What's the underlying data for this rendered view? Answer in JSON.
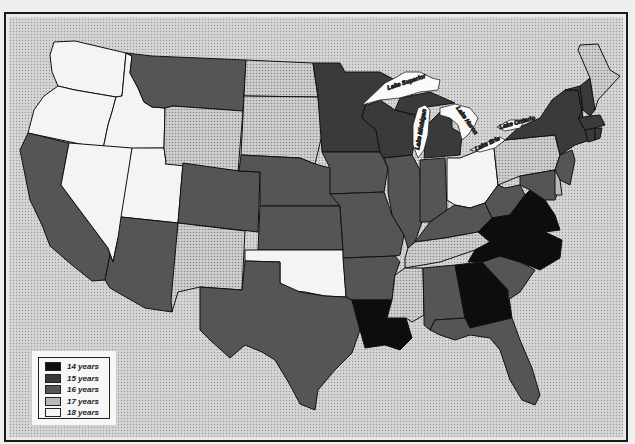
{
  "caption": "",
  "legend": {
    "items": [
      {
        "label": "14 years",
        "color": "#0d0d0d"
      },
      {
        "label": "15 years",
        "color": "#3a3a3a"
      },
      {
        "label": "16 years",
        "color": "#555555"
      },
      {
        "label": "17 years",
        "color": "#b8b8b8"
      },
      {
        "label": "18 years",
        "color": "#f4f4f4"
      }
    ]
  },
  "lakes": {
    "superior": "Lake Superior",
    "michigan": "Lake Michigan",
    "huron": "Lake Huron",
    "erie": "Lake Erie",
    "ontario": "Lake Ontario"
  },
  "colors": {
    "background": "#e8e8e8",
    "border": "#1a1a1a",
    "c14": "#0d0d0d",
    "c15": "#3a3a3a",
    "c16": "#555555",
    "c17": "#b8b8b8",
    "c18": "#f4f4f4"
  },
  "states": {
    "WA": 18,
    "OR": 18,
    "ID": 18,
    "NV": 18,
    "UT": 18,
    "OK": 18,
    "OH": 18,
    "CA": 16,
    "MT": 16,
    "AZ": 16,
    "CO": 16,
    "NE": 16,
    "KS": 16,
    "TX": 16,
    "MN": 15,
    "WI": 15,
    "IA": 16,
    "MO": 16,
    "IL": 16,
    "IN": 16,
    "MI": 15,
    "AR": 16,
    "KY": 16,
    "WV": 16,
    "AL": 16,
    "SC": 16,
    "FL": 16,
    "NY": 15,
    "VT": 15,
    "NH": 15,
    "MA": 15,
    "CT": 15,
    "RI": 15,
    "NJ": 16,
    "DE": 16,
    "MD": 16,
    "WY": 17,
    "ND": 17,
    "SD": 17,
    "NM": 17,
    "TN": 17,
    "MS": 17,
    "PA": 17,
    "ME": 17,
    "VA": 14,
    "NC": 14,
    "GA": 14,
    "LA": 14
  }
}
